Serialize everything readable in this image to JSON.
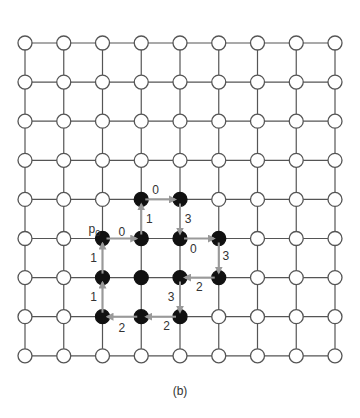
{
  "diagram": {
    "grid": {
      "cols": 9,
      "rows": 9,
      "origin_x": 25,
      "origin_y": 43,
      "spacing_x": 38.75,
      "spacing_y": 39.1,
      "node_radius": 7,
      "line_color": "#555555",
      "open_node_fill": "#ffffff",
      "open_node_stroke": "#555555",
      "filled_node_color": "#111111"
    },
    "filled_nodes": [
      [
        3,
        4
      ],
      [
        4,
        4
      ],
      [
        2,
        5
      ],
      [
        3,
        5
      ],
      [
        4,
        5
      ],
      [
        5,
        5
      ],
      [
        2,
        6
      ],
      [
        3,
        6
      ],
      [
        4,
        6
      ],
      [
        5,
        6
      ],
      [
        2,
        7
      ],
      [
        3,
        7
      ],
      [
        4,
        7
      ]
    ],
    "start_label": {
      "text": "p",
      "subscript": "0",
      "node": [
        2,
        5
      ]
    },
    "arrow_color": "#999999",
    "label_color": "#333333",
    "chain": [
      {
        "from": [
          2,
          5
        ],
        "to": [
          3,
          5
        ],
        "code": "0",
        "label_dx": 0,
        "label_dy": -7
      },
      {
        "from": [
          3,
          5
        ],
        "to": [
          3,
          4
        ],
        "code": "1",
        "label_dx": 8,
        "label_dy": 0
      },
      {
        "from": [
          3,
          4
        ],
        "to": [
          4,
          4
        ],
        "code": "0",
        "label_dx": -5,
        "label_dy": -9
      },
      {
        "from": [
          4,
          4
        ],
        "to": [
          4,
          5
        ],
        "code": "3",
        "label_dx": 8,
        "label_dy": 0
      },
      {
        "from": [
          4,
          5
        ],
        "to": [
          5,
          5
        ],
        "code": "0",
        "label_dx": -6,
        "label_dy": 10
      },
      {
        "from": [
          5,
          5
        ],
        "to": [
          5,
          6
        ],
        "code": "3",
        "label_dx": 7,
        "label_dy": -2
      },
      {
        "from": [
          5,
          6
        ],
        "to": [
          4,
          6
        ],
        "code": "2",
        "label_dx": 0,
        "label_dy": 9
      },
      {
        "from": [
          4,
          6
        ],
        "to": [
          4,
          7
        ],
        "code": "3",
        "label_dx": -9,
        "label_dy": 0
      },
      {
        "from": [
          4,
          7
        ],
        "to": [
          3,
          7
        ],
        "code": "2",
        "label_dx": 6,
        "label_dy": 9
      },
      {
        "from": [
          3,
          7
        ],
        "to": [
          2,
          7
        ],
        "code": "2",
        "label_dx": 0,
        "label_dy": 11
      },
      {
        "from": [
          2,
          7
        ],
        "to": [
          2,
          6
        ],
        "code": "1",
        "label_dx": -9,
        "label_dy": 0
      },
      {
        "from": [
          2,
          6
        ],
        "to": [
          2,
          5
        ],
        "code": "1",
        "label_dx": -9,
        "label_dy": 0
      }
    ]
  },
  "caption": "(b)"
}
